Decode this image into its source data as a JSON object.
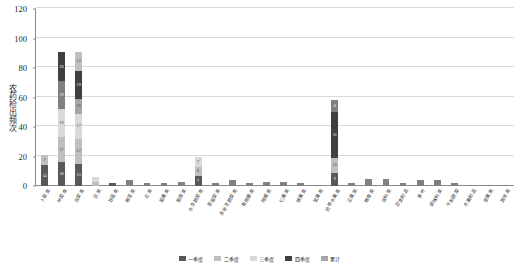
{
  "chart_data": {
    "type": "bar",
    "stacked": true,
    "title": "",
    "xlabel": "",
    "ylabel": "农药检出频次",
    "ylim": [
      0,
      120
    ],
    "yticks": [
      0,
      20,
      40,
      60,
      80,
      100,
      120
    ],
    "grid": true,
    "legend_position": "bottom",
    "series": [
      {
        "name": "一季度",
        "color": "#595959"
      },
      {
        "name": "二季度",
        "color": "#bfbfbf"
      },
      {
        "name": "三季度",
        "color": "#d9d9d9"
      },
      {
        "name": "四季度",
        "color": "#404040"
      },
      {
        "name": "累计",
        "color": "#a6a6a6"
      }
    ],
    "categories": [
      "卜菜类",
      "叶菜类",
      "白菜类",
      "豆类",
      "甘蓝类",
      "根茎类",
      "瓜类",
      "茄果类",
      "葱蒜类",
      "水生蔬菜类",
      "芽苗菜类",
      "多年生蔬菜类",
      "食用菌类",
      "柑橘类",
      "仁果类",
      "核果类",
      "浆果类",
      "热带水果类",
      "瓜果类",
      "粮食类",
      "油料类",
      "豆类制品",
      "茶叶",
      "调味料类",
      "干制蔬菜",
      "水果制品",
      "坚果类",
      "其他类"
    ],
    "values": [
      21,
      101,
      91,
      6,
      2,
      4,
      2,
      2,
      3,
      20,
      2,
      4,
      2,
      3,
      3,
      2,
      1,
      58,
      2,
      5,
      5,
      2,
      4,
      4,
      2,
      1,
      1,
      1
    ],
    "stacks": [
      [
        14,
        7
      ],
      [
        16,
        17,
        19,
        19,
        20
      ],
      [
        15,
        17,
        17,
        10,
        19,
        13
      ],
      [
        3,
        3
      ],
      [
        2
      ],
      [
        4
      ],
      [
        2
      ],
      [
        2
      ],
      [
        3
      ],
      [
        7,
        6,
        7
      ],
      [
        2
      ],
      [
        4
      ],
      [
        2
      ],
      [
        3
      ],
      [
        3
      ],
      [
        2
      ],
      [
        1
      ],
      [
        9,
        10,
        31,
        8
      ],
      [
        2
      ],
      [
        5
      ],
      [
        5
      ],
      [
        2
      ],
      [
        4
      ],
      [
        4
      ],
      [
        2
      ],
      [
        1
      ],
      [
        1
      ],
      [
        1
      ]
    ],
    "stack_labels": [
      [
        "14",
        "7"
      ],
      [
        "16",
        "17",
        "19",
        "19",
        "20"
      ],
      [
        "15",
        "17",
        "17",
        "10",
        "19",
        "13"
      ],
      [
        "3",
        "3"
      ],
      [
        ""
      ],
      [
        ""
      ],
      [
        ""
      ],
      [
        ""
      ],
      [
        ""
      ],
      [
        "7",
        "6",
        "7"
      ],
      [
        ""
      ],
      [
        ""
      ],
      [
        ""
      ],
      [
        ""
      ],
      [
        ""
      ],
      [
        ""
      ],
      [
        ""
      ],
      [
        "9",
        "10",
        "31",
        "8"
      ],
      [
        ""
      ],
      [
        ""
      ],
      [
        ""
      ],
      [
        ""
      ],
      [
        ""
      ],
      [
        ""
      ],
      [
        ""
      ],
      [
        ""
      ],
      [
        ""
      ],
      [
        ""
      ]
    ],
    "stack_colors": [
      [
        "#595959",
        "#bfbfbf"
      ],
      [
        "#595959",
        "#bfbfbf",
        "#d9d9d9",
        "#7f7f7f",
        "#404040"
      ],
      [
        "#595959",
        "#bfbfbf",
        "#d9d9d9",
        "#a6a6a6",
        "#404040",
        "#bfbfbf"
      ],
      [
        "#bfbfbf",
        "#d9d9d9"
      ],
      [
        "#595959"
      ],
      [
        "#808080"
      ],
      [
        "#808080"
      ],
      [
        "#808080"
      ],
      [
        "#808080"
      ],
      [
        "#595959",
        "#bfbfbf",
        "#d9d9d9"
      ],
      [
        "#808080"
      ],
      [
        "#808080"
      ],
      [
        "#808080"
      ],
      [
        "#808080"
      ],
      [
        "#808080"
      ],
      [
        "#808080"
      ],
      [
        "#808080"
      ],
      [
        "#595959",
        "#bfbfbf",
        "#404040",
        "#808080"
      ],
      [
        "#808080"
      ],
      [
        "#808080"
      ],
      [
        "#808080"
      ],
      [
        "#808080"
      ],
      [
        "#808080"
      ],
      [
        "#808080"
      ],
      [
        "#808080"
      ],
      [
        "#808080"
      ],
      [
        "#808080"
      ],
      [
        "#808080"
      ]
    ]
  }
}
